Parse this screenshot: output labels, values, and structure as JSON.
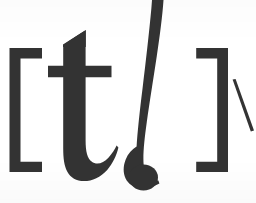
{
  "image": {
    "kind": "scanned-print",
    "subject": "phonetic-transcription",
    "width": 256,
    "height": 203,
    "description": "Large black printed phonetic transcription on white paper"
  },
  "colors": {
    "ink": "#333333",
    "paper": "#ffffff",
    "ink_light": "#3a3a3a"
  },
  "transcription": {
    "full_text": "[ tʃ ]",
    "open_bracket": "[",
    "close_bracket": "]",
    "phoneme": "tʃ",
    "trailing_mark": "\\"
  },
  "glyphs": [
    {
      "id": "open-bracket",
      "name": "left-square-bracket",
      "character": "[",
      "x": 9,
      "y": 48,
      "width": 33,
      "height": 124
    },
    {
      "id": "letter-t",
      "name": "latin-small-letter-t",
      "character": "t",
      "x": 48,
      "y": 30,
      "width": 70,
      "height": 152
    },
    {
      "id": "letter-esh",
      "name": "latin-small-letter-esh",
      "character": "ʃ",
      "x": 126,
      "y": 0,
      "width": 38,
      "height": 192
    },
    {
      "id": "close-bracket",
      "name": "right-square-bracket",
      "character": "]",
      "x": 196,
      "y": 48,
      "width": 32,
      "height": 124
    },
    {
      "id": "edge-mark",
      "name": "diagonal-stroke-mark",
      "character": "\\",
      "x": 232,
      "y": 79,
      "width": 22,
      "height": 53
    }
  ]
}
